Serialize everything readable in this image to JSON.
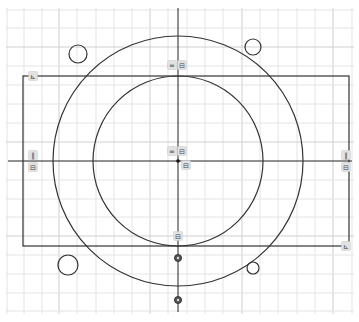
{
  "sketch": {
    "origin": {
      "x": 178,
      "y": 161
    },
    "grid": {
      "minor_color": "#e4e4e4",
      "major_color": "#cfcfcf",
      "vertical_lines": [
        7,
        24,
        42,
        59,
        77,
        96,
        114,
        132,
        150,
        168,
        187,
        205,
        223,
        242,
        260,
        278,
        297,
        315,
        333,
        352
      ],
      "horizontal_lines": [
        10,
        28,
        47,
        66,
        85,
        104,
        123,
        142,
        180,
        199,
        217,
        236,
        255,
        274,
        293,
        311
      ],
      "major_vertical": [
        59,
        150,
        242,
        333
      ],
      "major_horizontal": [
        47,
        142,
        236
      ]
    },
    "axes": {
      "color": "#222222",
      "x_from": 8,
      "x_to": 352,
      "y_from": 8,
      "y_to": 312
    },
    "line_color": "#333333",
    "rectangle": {
      "x1": 23,
      "y1": 76,
      "x2": 349,
      "y2": 246
    },
    "circles": [
      {
        "name": "outer-circle",
        "cx": 178,
        "cy": 161,
        "r": 125
      },
      {
        "name": "inner-circle",
        "cx": 178,
        "cy": 161,
        "r": 85
      },
      {
        "name": "small-circle-top-left",
        "cx": 78,
        "cy": 54,
        "r": 9
      },
      {
        "name": "small-circle-top-right",
        "cx": 253,
        "cy": 47,
        "r": 8
      },
      {
        "name": "small-circle-bottom-left",
        "cx": 68,
        "cy": 265,
        "r": 10
      },
      {
        "name": "small-circle-bottom-right",
        "cx": 253,
        "cy": 268,
        "r": 6
      }
    ],
    "points": [
      {
        "name": "origin-point",
        "x": 178,
        "y": 161
      },
      {
        "name": "construction-point-1",
        "x": 178,
        "y": 258
      },
      {
        "name": "construction-point-2",
        "x": 178,
        "y": 300
      }
    ],
    "constraint_badges": [
      {
        "name": "equal-constraint-top",
        "x": 172,
        "y": 65,
        "glyph": "="
      },
      {
        "name": "fix-constraint-top",
        "x": 182,
        "y": 65,
        "glyph": "⊟"
      },
      {
        "name": "equal-constraint-center",
        "x": 172,
        "y": 151,
        "glyph": "="
      },
      {
        "name": "fix-constraint-center",
        "x": 182,
        "y": 151,
        "glyph": "⊟"
      },
      {
        "name": "fix-constraint-center-2",
        "x": 186,
        "y": 165,
        "glyph": "⊟"
      },
      {
        "name": "parallel-constraint-left",
        "x": 33,
        "y": 155,
        "glyph": "∥"
      },
      {
        "name": "fix-constraint-left",
        "x": 33,
        "y": 167,
        "glyph": "⊟"
      },
      {
        "name": "parallel-constraint-right",
        "x": 346,
        "y": 155,
        "glyph": "∥"
      },
      {
        "name": "fix-constraint-right",
        "x": 346,
        "y": 167,
        "glyph": "⊟"
      },
      {
        "name": "perpendicular-constraint-top-left",
        "x": 33,
        "y": 76,
        "glyph": "⊾"
      },
      {
        "name": "perpendicular-constraint-bottom-right",
        "x": 346,
        "y": 246,
        "glyph": "⊾"
      },
      {
        "name": "fix-constraint-bottom",
        "x": 178,
        "y": 236,
        "glyph": "⊟"
      }
    ]
  }
}
